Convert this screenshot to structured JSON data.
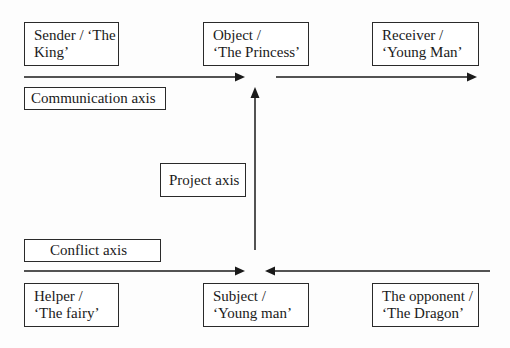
{
  "diagram": {
    "type": "actantial-model",
    "nodes": {
      "sender": {
        "line1": "Sender / ‘The",
        "line2": "King’"
      },
      "object": {
        "line1": "Object /",
        "line2": "‘The Princess’"
      },
      "receiver": {
        "line1": "Receiver /",
        "line2": "‘Young Man’"
      },
      "helper": {
        "line1": "Helper /",
        "line2": "‘The fairy’"
      },
      "subject": {
        "line1": "Subject /",
        "line2": "‘Young man’"
      },
      "opponent": {
        "line1": "The opponent /",
        "line2": "‘The Dragon’"
      }
    },
    "axes": {
      "communication": "Communication axis",
      "project": "Project axis",
      "conflict": "Conflict axis"
    },
    "edges": [
      {
        "from": "sender",
        "to": "object",
        "axis": "communication",
        "direction": "right"
      },
      {
        "from": "object",
        "to": "receiver",
        "axis": "communication",
        "direction": "right"
      },
      {
        "from": "subject",
        "to": "object",
        "axis": "project",
        "direction": "up"
      },
      {
        "from": "helper",
        "to": "subject",
        "axis": "conflict",
        "direction": "right"
      },
      {
        "from": "opponent",
        "to": "subject",
        "axis": "conflict",
        "direction": "left"
      }
    ],
    "colors": {
      "line": "#1a1a1a",
      "border": "#2a2a2a",
      "background": "#ffffff"
    }
  }
}
